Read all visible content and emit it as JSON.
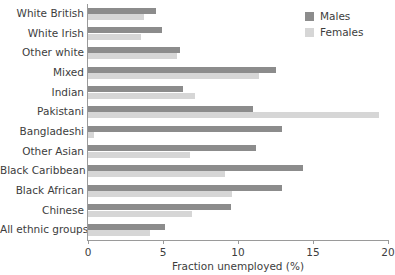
{
  "chart_data": {
    "type": "bar",
    "orientation": "horizontal",
    "title": "",
    "xlabel": "Fraction unemployed (%)",
    "ylabel": "",
    "xlim": [
      0,
      20
    ],
    "xticks": [
      0,
      5,
      10,
      15,
      20
    ],
    "xticklabels": [
      "0",
      "5",
      "10",
      "15",
      "20"
    ],
    "grid": false,
    "legend_position": "top-right",
    "categories": [
      "White British",
      "White Irish",
      "Other white",
      "Mixed",
      "Indian",
      "Pakistani",
      "Bangladeshi",
      "Other Asian",
      "Black Caribbean",
      "Black African",
      "Chinese",
      "All ethnic groups"
    ],
    "series": [
      {
        "name": "Males",
        "color": "#8c8c8c",
        "values": [
          4.5,
          4.9,
          6.1,
          12.5,
          6.3,
          11.0,
          12.9,
          11.2,
          14.3,
          12.9,
          9.5,
          5.1
        ]
      },
      {
        "name": "Females",
        "color": "#d6d6d6",
        "values": [
          3.7,
          3.5,
          5.9,
          11.4,
          7.1,
          19.4,
          0.4,
          6.8,
          9.1,
          9.6,
          6.9,
          4.1
        ]
      }
    ]
  },
  "legend": {
    "items": [
      {
        "label": "Males",
        "color": "#8c8c8c",
        "swatch_name": "legend-swatch-males"
      },
      {
        "label": "Females",
        "color": "#d6d6d6",
        "swatch_name": "legend-swatch-females"
      }
    ]
  }
}
